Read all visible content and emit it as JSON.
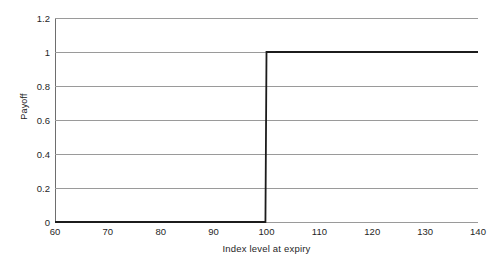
{
  "chart_data": {
    "type": "line",
    "title": "",
    "subtitle": "",
    "xlabel": "Index level at expiry",
    "ylabel": "Payoff",
    "xlim": [
      60,
      140
    ],
    "ylim": [
      0,
      1.2
    ],
    "xticks": [
      "60",
      "70",
      "80",
      "90",
      "100",
      "110",
      "120",
      "130",
      "140"
    ],
    "xtick_values": [
      60,
      70,
      80,
      90,
      100,
      110,
      120,
      130,
      140
    ],
    "yticks": [
      "0",
      "0.2",
      "0.4",
      "0.6",
      "0.8",
      "1",
      "1.2"
    ],
    "ytick_values": [
      0,
      0.2,
      0.4,
      0.6,
      0.8,
      1,
      1.2
    ],
    "grid": "horizontal",
    "legend": "none",
    "annotations": [],
    "series": [
      {
        "name": "Payoff",
        "color": "#1c1c1c",
        "x": [
          60,
          99.8,
          100,
          140
        ],
        "values": [
          0,
          0,
          1,
          1
        ]
      }
    ]
  },
  "style": {
    "background": "#ffffff",
    "grid_color": "#9a9a9a",
    "axis_color": "#6e6e6e",
    "curve_color": "#1c1c1c",
    "text_color": "#1f1f1f"
  }
}
